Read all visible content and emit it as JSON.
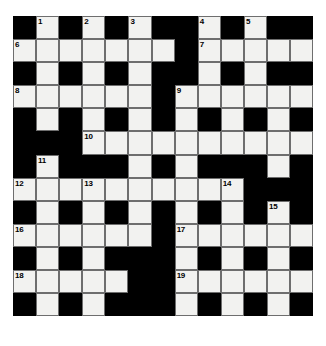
{
  "puzzle": {
    "type": "crossword-grid",
    "rows": 13,
    "columns": 13,
    "cell_size_px": 23.1,
    "colors": {
      "block": "#000000",
      "open": "#f2f2f0",
      "cell_border": "#6e6e6e",
      "number_text": "#000000",
      "page_background": "#ffffff"
    },
    "numbers_total": 19,
    "grid": [
      [
        "block",
        "open",
        "block",
        "open",
        "block",
        "open",
        "block",
        "block",
        "open",
        "block",
        "open",
        "block",
        "block"
      ],
      [
        "open",
        "open",
        "open",
        "open",
        "open",
        "open",
        "open",
        "block",
        "open",
        "open",
        "open",
        "open",
        "open"
      ],
      [
        "block",
        "open",
        "block",
        "open",
        "block",
        "open",
        "block",
        "block",
        "open",
        "block",
        "open",
        "block",
        "block"
      ],
      [
        "open",
        "open",
        "open",
        "open",
        "open",
        "open",
        "block",
        "open",
        "open",
        "open",
        "open",
        "open",
        "open"
      ],
      [
        "block",
        "open",
        "block",
        "open",
        "block",
        "open",
        "block",
        "open",
        "block",
        "open",
        "block",
        "open",
        "block"
      ],
      [
        "block",
        "block",
        "block",
        "open",
        "open",
        "open",
        "open",
        "open",
        "open",
        "open",
        "open",
        "open",
        "open"
      ],
      [
        "block",
        "open",
        "block",
        "block",
        "block",
        "open",
        "block",
        "open",
        "block",
        "block",
        "block",
        "open",
        "block"
      ],
      [
        "open",
        "open",
        "open",
        "open",
        "open",
        "open",
        "open",
        "open",
        "open",
        "open",
        "block",
        "block",
        "block"
      ],
      [
        "block",
        "open",
        "block",
        "open",
        "block",
        "open",
        "block",
        "open",
        "block",
        "open",
        "block",
        "open",
        "block"
      ],
      [
        "open",
        "open",
        "open",
        "open",
        "open",
        "open",
        "block",
        "open",
        "open",
        "open",
        "open",
        "open",
        "open"
      ],
      [
        "block",
        "open",
        "block",
        "open",
        "block",
        "block",
        "block",
        "open",
        "block",
        "open",
        "block",
        "open",
        "block"
      ],
      [
        "open",
        "open",
        "open",
        "open",
        "open",
        "block",
        "block",
        "open",
        "open",
        "open",
        "open",
        "open",
        "open"
      ],
      [
        "block",
        "open",
        "block",
        "open",
        "block",
        "block",
        "block",
        "open",
        "block",
        "open",
        "block",
        "open",
        "block"
      ]
    ],
    "numbered_cells": [
      {
        "number": "1",
        "row": 0,
        "col": 1
      },
      {
        "number": "2",
        "row": 0,
        "col": 3
      },
      {
        "number": "3",
        "row": 0,
        "col": 5
      },
      {
        "number": "4",
        "row": 0,
        "col": 8
      },
      {
        "number": "5",
        "row": 0,
        "col": 10
      },
      {
        "number": "6",
        "row": 1,
        "col": 0
      },
      {
        "number": "7",
        "row": 1,
        "col": 8
      },
      {
        "number": "8",
        "row": 3,
        "col": 0
      },
      {
        "number": "9",
        "row": 3,
        "col": 7
      },
      {
        "number": "10",
        "row": 5,
        "col": 3
      },
      {
        "number": "11",
        "row": 6,
        "col": 1
      },
      {
        "number": "12",
        "row": 7,
        "col": 0
      },
      {
        "number": "13",
        "row": 7,
        "col": 3
      },
      {
        "number": "14",
        "row": 7,
        "col": 9
      },
      {
        "number": "15",
        "row": 8,
        "col": 11
      },
      {
        "number": "16",
        "row": 9,
        "col": 0
      },
      {
        "number": "17",
        "row": 9,
        "col": 7
      },
      {
        "number": "18",
        "row": 11,
        "col": 0
      },
      {
        "number": "19",
        "row": 11,
        "col": 7
      }
    ]
  }
}
